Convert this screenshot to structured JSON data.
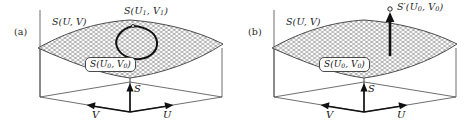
{
  "figure": {
    "kind": "two-panel-3d-surface-diagram",
    "background_color": "#ffffff",
    "ink_color": "#1a1a1a",
    "mesh_color": "#6e6e6e"
  },
  "panels": [
    {
      "tag": "(a)",
      "surface_label": "S(U, V)",
      "point_label": "S(U1, V1)",
      "point_label_parts": {
        "head": "S(U",
        "sub1": "1",
        "mid": ", V",
        "sub2": "1",
        "tail": ")"
      },
      "boxed_label": "S(U0, V0)",
      "boxed_label_parts": {
        "head": "S(U",
        "sub1": "0",
        "mid": ", V",
        "sub2": "0",
        "tail": ")"
      },
      "annotation": "closed-loop-cycle-on-surface",
      "axes": {
        "vertical": "S",
        "left": "V",
        "right": "U"
      }
    },
    {
      "tag": "(b)",
      "surface_label": "S(U, V)",
      "point_label": "S'(U0, V0)",
      "point_label_parts": {
        "head": "S′(U",
        "sub1": "0",
        "mid": ", V",
        "sub2": "0",
        "tail": ")"
      },
      "boxed_label": "S(U0, V0)",
      "boxed_label_parts": {
        "head": "S(U",
        "sub1": "0",
        "mid": ", V",
        "sub2": "0",
        "tail": ")"
      },
      "annotation": "vertical-arrow-to-off-surface-point",
      "axes": {
        "vertical": "S",
        "left": "V",
        "right": "U"
      }
    }
  ]
}
